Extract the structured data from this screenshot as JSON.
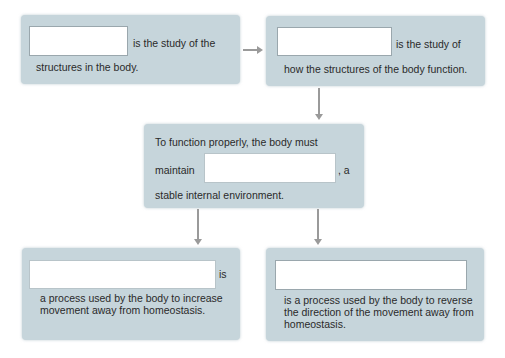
{
  "colors": {
    "box_fill": "#c6d5db",
    "arrow": "#9a9a9a",
    "text": "#2a2a2a",
    "blank_fill": "#ffffff"
  },
  "boxes": {
    "anatomy": {
      "blank_value": "",
      "text_line1": "is the study of the",
      "text_line2": "structures in the body."
    },
    "physiology": {
      "blank_value": "",
      "text_line1": "is the study of",
      "text_line2": "how the structures of the body function."
    },
    "homeostasis": {
      "text_line1": "To function properly, the body must",
      "text_before_blank": "maintain",
      "blank_value": "",
      "text_after_blank": ", a",
      "text_line3": "stable internal environment."
    },
    "positive_feedback": {
      "blank_value": "",
      "text_after_blank": "is",
      "text_line2": "a process used by the body to increase",
      "text_line3": "movement away from homeostasis."
    },
    "negative_feedback": {
      "blank_value": "",
      "text_line1": "is a process used by the body to reverse",
      "text_line2": "the direction of the movement away from",
      "text_line3": "homeostasis."
    }
  },
  "arrows": [
    {
      "from": "anatomy",
      "to": "physiology",
      "direction": "right"
    },
    {
      "from": "physiology",
      "to": "homeostasis",
      "direction": "down"
    },
    {
      "from": "homeostasis",
      "to": "positive_feedback",
      "direction": "down"
    },
    {
      "from": "homeostasis",
      "to": "negative_feedback",
      "direction": "down"
    }
  ]
}
